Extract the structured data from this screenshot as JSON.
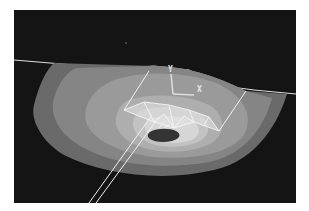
{
  "figure": {
    "type": "fea-contour-plot",
    "background_color": "#141414",
    "frame_color": "#ffffff",
    "triad": {
      "y_label": "Y",
      "x_label": "X"
    },
    "contour_bands": [
      {
        "level": 1,
        "color": "#6e6e6e"
      },
      {
        "level": 2,
        "color": "#8a8a8a"
      },
      {
        "level": 3,
        "color": "#9c9c9c"
      },
      {
        "level": 4,
        "color": "#b0b0b0"
      },
      {
        "level": 5,
        "color": "#c4c4c4"
      },
      {
        "level": 6,
        "color": "#d8d8d8"
      },
      {
        "level": 7,
        "color": "#3a3a3a"
      }
    ],
    "wireframe_color": "#f0f0f0"
  }
}
